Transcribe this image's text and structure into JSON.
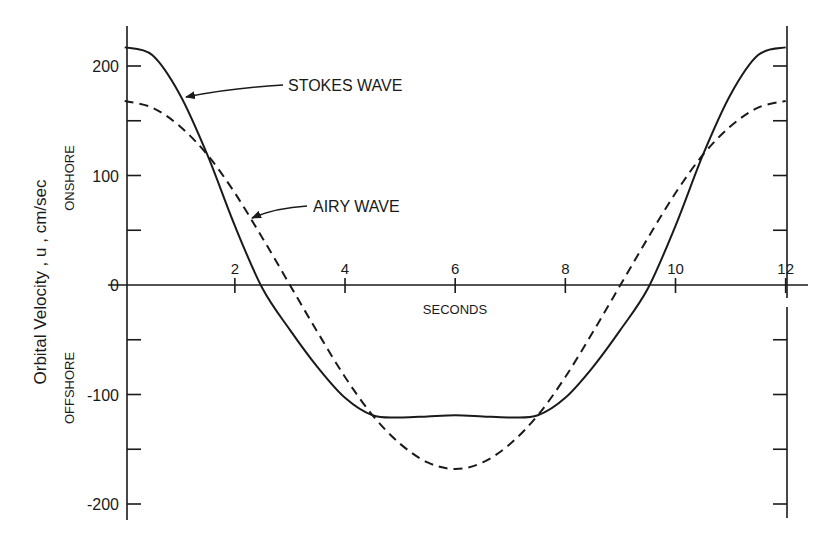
{
  "chart_data": {
    "type": "line",
    "title": "",
    "xlabel": "SECONDS",
    "ylabel": "Orbital Velocity , u , cm/sec",
    "ylabel_onshore": "ONSHORE",
    "ylabel_offshore": "OFFSHORE",
    "xlim": [
      0,
      12
    ],
    "ylim": [
      -200,
      200
    ],
    "x_ticks": [
      2,
      4,
      6,
      8,
      10,
      12
    ],
    "x_tick_labels": [
      "2",
      "4",
      "6",
      "8",
      "10",
      "12"
    ],
    "y_ticks": [
      200,
      150,
      100,
      50,
      0,
      -50,
      -100,
      -150,
      -200
    ],
    "y_tick_labels": [
      "200",
      "",
      "100",
      "",
      "0",
      "",
      "-100",
      "",
      "-200"
    ],
    "grid": false,
    "legend": "inline annotations with arrows",
    "x": [
      0,
      0.5,
      1,
      1.5,
      2,
      2.5,
      3,
      3.5,
      4,
      4.5,
      5,
      5.5,
      6,
      6.5,
      7,
      7.5,
      8,
      8.5,
      9,
      9.5,
      10,
      10.5,
      11,
      11.5,
      12
    ],
    "series": [
      {
        "name": "STOKES WAVE",
        "style": "solid",
        "values": [
          217,
          210,
          174,
          119,
          54,
          -3,
          -41,
          -75,
          -103,
          -119,
          -121,
          -120,
          -119,
          -120,
          -121,
          -119,
          -103,
          -75,
          -41,
          -3,
          54,
          119,
          174,
          210,
          217
        ]
      },
      {
        "name": "AIRY WAVE",
        "style": "dashed",
        "values": [
          168,
          162,
          145,
          119,
          84,
          43,
          0,
          -43,
          -84,
          -119,
          -145,
          -162,
          -168,
          -162,
          -145,
          -119,
          -84,
          -43,
          0,
          43,
          84,
          119,
          145,
          162,
          168
        ]
      }
    ],
    "annotations": [
      {
        "text": "STOKES WAVE",
        "arrow_to": [
          1.08,
          170
        ]
      },
      {
        "text": "AIRY WAVE",
        "arrow_to": [
          2.28,
          60
        ]
      }
    ]
  }
}
